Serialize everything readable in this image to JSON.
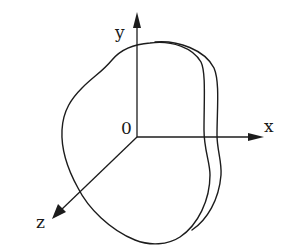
{
  "figure": {
    "axes": {
      "x_label": "x",
      "y_label": "y",
      "z_label": "z",
      "origin_label": "0"
    },
    "body": {
      "name": "irregular-slab",
      "front_face": "outer closed curve",
      "back_face": "offset curve on right side showing thickness"
    }
  }
}
